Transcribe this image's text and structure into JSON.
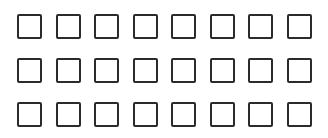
{
  "grid": {
    "rows": 3,
    "columns": 8,
    "origin_x": 17,
    "origin_y": 14,
    "col_spacing": 38.5,
    "row_spacing": 44,
    "box_color": "#2b2b2b",
    "background": "#ffffff",
    "boxes": [
      {
        "row": 0,
        "col": 0,
        "checked": false
      },
      {
        "row": 0,
        "col": 1,
        "checked": false
      },
      {
        "row": 0,
        "col": 2,
        "checked": false
      },
      {
        "row": 0,
        "col": 3,
        "checked": false
      },
      {
        "row": 0,
        "col": 4,
        "checked": false
      },
      {
        "row": 0,
        "col": 5,
        "checked": false
      },
      {
        "row": 0,
        "col": 6,
        "checked": false
      },
      {
        "row": 0,
        "col": 7,
        "checked": false
      },
      {
        "row": 1,
        "col": 0,
        "checked": false
      },
      {
        "row": 1,
        "col": 1,
        "checked": false
      },
      {
        "row": 1,
        "col": 2,
        "checked": false
      },
      {
        "row": 1,
        "col": 3,
        "checked": false
      },
      {
        "row": 1,
        "col": 4,
        "checked": false
      },
      {
        "row": 1,
        "col": 5,
        "checked": false
      },
      {
        "row": 1,
        "col": 6,
        "checked": false
      },
      {
        "row": 1,
        "col": 7,
        "checked": false
      },
      {
        "row": 2,
        "col": 0,
        "checked": false
      },
      {
        "row": 2,
        "col": 1,
        "checked": false
      },
      {
        "row": 2,
        "col": 2,
        "checked": false
      },
      {
        "row": 2,
        "col": 3,
        "checked": false
      },
      {
        "row": 2,
        "col": 4,
        "checked": false
      },
      {
        "row": 2,
        "col": 5,
        "checked": false
      },
      {
        "row": 2,
        "col": 6,
        "checked": false
      },
      {
        "row": 2,
        "col": 7,
        "checked": false
      }
    ]
  }
}
